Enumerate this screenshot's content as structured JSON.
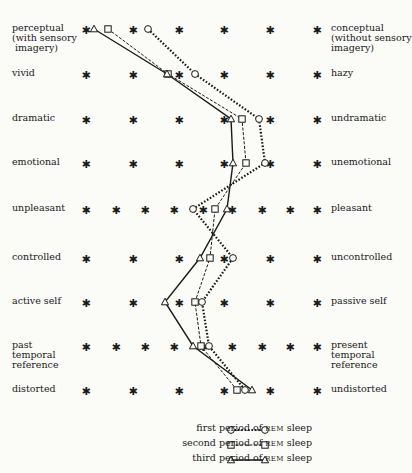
{
  "chart_data": {
    "type": "line",
    "orientation": "profile (vertical semantic differential)",
    "title": "",
    "scale_points_note": "Each row is a bipolar rating scale marked with asterisks; lines connect mean ratings per REM period",
    "rows": [
      {
        "left": "perceptual\n(with sensory\n imagery)",
        "right": "conceptual\n(without sensory\nimagery)",
        "y": 29,
        "scale_x": [
          86,
          133,
          179,
          224,
          270,
          317
        ]
      },
      {
        "left": "vivid",
        "right": "hazy",
        "y": 74,
        "scale_x": [
          86,
          133,
          179,
          224,
          270,
          317
        ]
      },
      {
        "left": "dramatic",
        "right": "undramatic",
        "y": 119,
        "scale_x": [
          86,
          133,
          179,
          224,
          270,
          317
        ]
      },
      {
        "left": "emotional",
        "right": "unemotional",
        "y": 163,
        "scale_x": [
          86,
          133,
          179,
          224,
          270,
          317
        ]
      },
      {
        "left": "unpleasant",
        "right": "pleasant",
        "y": 209,
        "scale_x": [
          86,
          116,
          145,
          174,
          203,
          232,
          262,
          290,
          317
        ]
      },
      {
        "left": "controlled",
        "right": "uncontrolled",
        "y": 258,
        "scale_x": [
          86,
          133,
          179,
          224,
          270,
          317
        ]
      },
      {
        "left": "active self",
        "right": "passive self",
        "y": 302,
        "scale_x": [
          86,
          133,
          179,
          224,
          270,
          317
        ]
      },
      {
        "left": "past\ntemporal\nreference",
        "right": "present\ntemporal\nreference",
        "y": 346,
        "scale_x": [
          86,
          116,
          145,
          174,
          203,
          232,
          262,
          290,
          317
        ]
      },
      {
        "left": "distorted",
        "right": "undistorted",
        "y": 390,
        "scale_x": [
          86,
          133,
          179,
          224,
          270,
          317
        ]
      }
    ],
    "series": [
      {
        "name": "first period of REM sleep",
        "marker": "circle",
        "line": "dotted",
        "x": [
          148,
          195,
          259,
          265,
          193,
          233,
          202,
          209,
          245
        ]
      },
      {
        "name": "second period of REM sleep",
        "marker": "square",
        "line": "dashed",
        "x": [
          108,
          168,
          242,
          246,
          215,
          210,
          195,
          201,
          237
        ]
      },
      {
        "name": "third period of REM sleep",
        "marker": "triangle",
        "line": "solid",
        "x": [
          94,
          167,
          231,
          233,
          227,
          200,
          165,
          193,
          252
        ]
      }
    ],
    "legend_position": "bottom center",
    "grid": false
  },
  "legend": {
    "items": [
      {
        "prefix": "first period of ",
        "sc": "REM",
        "suffix": " sleep"
      },
      {
        "prefix": "second period of ",
        "sc": "REM",
        "suffix": " sleep"
      },
      {
        "prefix": "third period of ",
        "sc": "REM",
        "suffix": " sleep"
      }
    ]
  },
  "colors": {
    "ink": "#1a1a1a",
    "paper": "#fbfbf8"
  }
}
